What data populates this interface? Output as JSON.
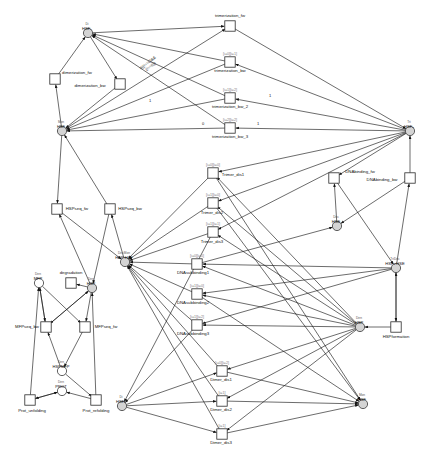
{
  "diagram": {
    "type": "petri-net",
    "width": 446,
    "height": 468,
    "colors": {
      "place_fill": "#d4d4d4",
      "place_open": "#ffffff",
      "transition_fill": "#ffffff",
      "stroke": "#111111",
      "guard_text": "#7d7d7d"
    }
  },
  "places": [
    {
      "id": "hsf2",
      "name": "HSF₂",
      "role": "Di",
      "x": 88,
      "y": 33,
      "filled": true
    },
    {
      "id": "hsf_mon",
      "name": "HSF",
      "role": "Mon",
      "x": 62,
      "y": 131,
      "filled": true
    },
    {
      "id": "hsf3",
      "name": "HSF₃",
      "role": "Tri",
      "x": 410,
      "y": 131,
      "filled": true
    },
    {
      "id": "hse",
      "name": "HSE",
      "role": "Dec",
      "x": 337,
      "y": 226,
      "filled": true
    },
    {
      "id": "hsf3hse",
      "name": "HSF₃:HSE",
      "role": "TriDec",
      "x": 396,
      "y": 268,
      "filled": true
    },
    {
      "id": "hsphsf",
      "name": "HSP:HSF",
      "role": "DecMon",
      "x": 125,
      "y": 262,
      "filled": true
    },
    {
      "id": "mfp",
      "name": "MFP",
      "role": "Den",
      "x": 39,
      "y": 283,
      "filled": false
    },
    {
      "id": "hsp_left",
      "name": "HSP",
      "role": "Den",
      "x": 92,
      "y": 288,
      "filled": true
    },
    {
      "id": "hsp_right",
      "name": "HSP",
      "role": "Den",
      "x": 360,
      "y": 327,
      "filled": true
    },
    {
      "id": "hspmfp",
      "name": "HSPMFP",
      "role": "Den",
      "x": 62,
      "y": 371,
      "filled": false
    },
    {
      "id": "prot",
      "name": "PROT",
      "role": "Den",
      "x": 62,
      "y": 391,
      "filled": false
    },
    {
      "id": "hsf2b",
      "name": "HSF₂",
      "role": "Di",
      "x": 122,
      "y": 406,
      "filled": true
    },
    {
      "id": "hsf_bot",
      "name": "HSF",
      "role": "Mon",
      "x": 363,
      "y": 404,
      "filled": true
    }
  ],
  "transitions": [
    {
      "id": "dim_fw",
      "label": "dimerization_fw",
      "x": 55,
      "y": 79,
      "guard": "",
      "label_dx": 22,
      "label_dy": -6
    },
    {
      "id": "dim_bw",
      "label": "dimerization_bw",
      "x": 120,
      "y": 84,
      "guard": "",
      "label_dx": -30,
      "label_dy": 2
    },
    {
      "id": "tri_fw",
      "label": "trimerization_fw",
      "x": 230,
      "y": 26,
      "guard": "",
      "label_dx": 0,
      "label_dy": -10
    },
    {
      "id": "tri_bw",
      "label": "trimerization_bw",
      "x": 230,
      "y": 62,
      "guard": "[i=0][i=1]",
      "label_dx": 0,
      "label_dy": 9
    },
    {
      "id": "tri_bw2",
      "label": "trimerization_bw_2",
      "x": 230,
      "y": 98,
      "guard": "[i=1][i=2]",
      "label_dx": 0,
      "label_dy": 9
    },
    {
      "id": "tri_bw3",
      "label": "trimerization_bw_3",
      "x": 230,
      "y": 128,
      "guard": "[i=2][i=2]",
      "label_dx": 0,
      "label_dy": 9
    },
    {
      "id": "dna_fw",
      "label": "DNAbinding_fw",
      "x": 334,
      "y": 178,
      "guard": "",
      "label_dx": 26,
      "label_dy": -6
    },
    {
      "id": "dna_bw",
      "label": "DNAbinding_bw",
      "x": 410,
      "y": 178,
      "guard": "",
      "label_dx": -28,
      "label_dy": 2
    },
    {
      "id": "trimer1",
      "label": "Trimer_dis1",
      "x": 213,
      "y": 173,
      "guard": "[i=0][i=0]",
      "label_dx": 20,
      "label_dy": 2
    },
    {
      "id": "trimer2",
      "label": "Trimer_dis2",
      "x": 213,
      "y": 203,
      "guard": "[i=1][i=0]",
      "label_dx": -1,
      "label_dy": 10
    },
    {
      "id": "trimer3",
      "label": "Trimer_dis3",
      "x": 213,
      "y": 232,
      "guard": "[i=1][i=1]",
      "label_dx": -1,
      "label_dy": 10
    },
    {
      "id": "dnasub1",
      "label": "DNAsubbinding1",
      "x": 197,
      "y": 264,
      "guard": "[i=0][i=0]",
      "label_dx": -4,
      "label_dy": 9
    },
    {
      "id": "dnasub2",
      "label": "DNAsubbinding2",
      "x": 197,
      "y": 294,
      "guard": "[i=1][i=0]",
      "label_dx": -4,
      "label_dy": 9
    },
    {
      "id": "dnasub3",
      "label": "DNAsubbinding3",
      "x": 197,
      "y": 325,
      "guard": "[i=1][i=2]",
      "label_dx": -4,
      "label_dy": 9
    },
    {
      "id": "dimer1",
      "label": "Dimer_dis1",
      "x": 222,
      "y": 371,
      "guard": "[i=0][i=2]",
      "label_dx": -1,
      "label_dy": 9
    },
    {
      "id": "dimer2",
      "label": "Dimer_dis2",
      "x": 222,
      "y": 401,
      "guard": "[i=1]",
      "label_dx": -1,
      "label_dy": 9
    },
    {
      "id": "dimer3",
      "label": "Dimer_dis3",
      "x": 222,
      "y": 434,
      "guard": "[i=1]",
      "label_dx": -1,
      "label_dy": 9
    },
    {
      "id": "hspform",
      "label": "HSPformation",
      "x": 396,
      "y": 327,
      "guard": "",
      "label_dx": 0,
      "label_dy": 10
    },
    {
      "id": "hspseq_fw",
      "label": "HSPseq_fw",
      "x": 57,
      "y": 209,
      "guard": "",
      "label_dx": 20,
      "label_dy": 0
    },
    {
      "id": "hspseq_bw",
      "label": "HSPseq_bw",
      "x": 110,
      "y": 209,
      "guard": "",
      "label_dx": 20,
      "label_dy": 0
    },
    {
      "id": "degrad",
      "label": "degradation",
      "x": 71,
      "y": 283,
      "guard": "",
      "label_dx": 0,
      "label_dy": -10
    },
    {
      "id": "mfpseq_bw",
      "label": "MFPseq_bw",
      "x": 46,
      "y": 327,
      "guard": "",
      "label_dx": -19,
      "label_dy": 0
    },
    {
      "id": "mfpseq_fw",
      "label": "MFPseq_fw",
      "x": 85,
      "y": 327,
      "guard": "",
      "label_dx": 21,
      "label_dy": 0
    },
    {
      "id": "prot_unf",
      "label": "Prot_unfolding",
      "x": 30,
      "y": 400,
      "guard": "",
      "label_dx": 2,
      "label_dy": 11
    },
    {
      "id": "prot_ref",
      "label": "Prot_refolding",
      "x": 96,
      "y": 400,
      "guard": "",
      "label_dx": 0,
      "label_dy": 11
    }
  ],
  "arc_labels": [
    {
      "text": "if((i==0)&&\n(i==0))",
      "x": 148,
      "y": 63
    },
    {
      "text": "1",
      "x": 150,
      "y": 101
    },
    {
      "text": "1",
      "x": 270,
      "y": 96
    },
    {
      "text": "0",
      "x": 203,
      "y": 124
    },
    {
      "text": "1",
      "x": 258,
      "y": 124
    }
  ],
  "legend": {
    "place_shape": "circle",
    "transition_shape": "square",
    "arc_style": "directed-arrow"
  }
}
